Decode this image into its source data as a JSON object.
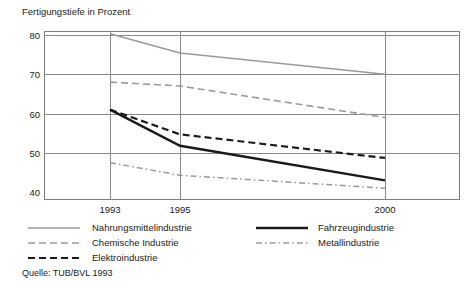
{
  "chart_data": {
    "type": "line",
    "title": "Fertigungstiefe in Prozent",
    "xlabel": "",
    "ylabel": "",
    "categories": [
      "1993",
      "1995",
      "2000"
    ],
    "x": [
      1993,
      1995,
      2000
    ],
    "ylim": [
      38,
      81
    ],
    "yticks": [
      40,
      50,
      60,
      70,
      80
    ],
    "ytick_labels": [
      "40",
      "50",
      "60",
      "70",
      "80"
    ],
    "xticks": [
      1993,
      1995,
      2000
    ],
    "xtick_labels": [
      "1993",
      "1995",
      "2000"
    ],
    "grid": "horizontal-and-vertical",
    "legend_position": "below-plot-two-columns",
    "series": [
      {
        "name": "Nahrungsmittelindustrie",
        "values": [
          80.3,
          75.4,
          70.0
        ],
        "style": "solid",
        "color": "#9a9a9a",
        "width": 1.6
      },
      {
        "name": "Chemische Industrie",
        "values": [
          68.0,
          67.0,
          59.0
        ],
        "style": "dashed",
        "color": "#9a9a9a",
        "width": 1.6
      },
      {
        "name": "Elektroindustrie",
        "values": [
          61.0,
          54.7,
          48.7
        ],
        "style": "dashed",
        "color": "#1a1a1a",
        "width": 2.2
      },
      {
        "name": "Fahrzeugindustrie",
        "values": [
          61.0,
          51.8,
          43.0
        ],
        "style": "solid",
        "color": "#1a1a1a",
        "width": 2.4
      },
      {
        "name": "Metallindustrie",
        "values": [
          47.5,
          44.3,
          41.0
        ],
        "style": "dash-dot",
        "color": "#9a9a9a",
        "width": 1.5
      }
    ],
    "source_note": "Quelle: TUB/BVL 1993"
  },
  "legend": {
    "left_column": [
      {
        "label": "Nahrungsmittelindustrie",
        "series_index": 0
      },
      {
        "label": "Chemische Industrie",
        "series_index": 1
      },
      {
        "label": "Elektroindustrie",
        "series_index": 2
      }
    ],
    "right_column": [
      {
        "label": "Fahrzeugindustrie",
        "series_index": 3
      },
      {
        "label": "Metallindustrie",
        "series_index": 4
      }
    ]
  },
  "colors": {
    "gray_series": "#9a9a9a",
    "black_series": "#1a1a1a",
    "grid": "#8a8a8a",
    "frame": "#7d7d7d",
    "background": "#ffffff"
  }
}
